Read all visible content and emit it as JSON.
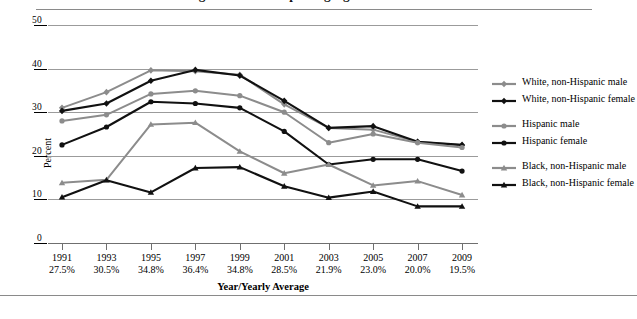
{
  "figure": {
    "title_partial": "Percentage of students reporting cigarette use",
    "y_axis_title": "Percent",
    "x_axis_title": "Year/Yearly Average"
  },
  "chart_data": {
    "type": "line",
    "title": "Percentage of students reporting cigarette use",
    "xlabel": "Year/Yearly Average",
    "ylabel": "Percent",
    "ylim": [
      0,
      50
    ],
    "yticks": [
      0,
      10,
      20,
      30,
      40,
      50
    ],
    "grid": true,
    "legend_position": "right",
    "categories": [
      "1991",
      "1993",
      "1995",
      "1997",
      "1999",
      "2001",
      "2003",
      "2005",
      "2007",
      "2009"
    ],
    "category_sublabels": [
      "27.5%",
      "30.5%",
      "34.8%",
      "36.4%",
      "34.8%",
      "28.5%",
      "21.9%",
      "23.0%",
      "20.0%",
      "19.5%"
    ],
    "series": [
      {
        "name": "White, non-Hispanic male",
        "color": "#8c8c8c",
        "marker": "diamond",
        "values": [
          31.0,
          34.6,
          39.6,
          39.4,
          38.6,
          31.8,
          26.4,
          26.0,
          23.2,
          22.4
        ]
      },
      {
        "name": "White, non-Hispanic female",
        "color": "#111111",
        "marker": "diamond",
        "values": [
          30.3,
          32.0,
          37.2,
          39.7,
          38.4,
          32.6,
          26.4,
          26.8,
          23.2,
          22.5
        ]
      },
      {
        "name": "Hispanic male",
        "color": "#8c8c8c",
        "marker": "circle",
        "values": [
          28.0,
          29.4,
          34.2,
          34.9,
          33.8,
          30.0,
          23.0,
          25.0,
          23.0,
          21.9
        ]
      },
      {
        "name": "Hispanic female",
        "color": "#111111",
        "marker": "circle",
        "values": [
          22.5,
          26.6,
          32.4,
          32.0,
          31.0,
          25.6,
          18.0,
          19.2,
          19.2,
          16.5
        ]
      },
      {
        "name": "Black, non-Hispanic male",
        "color": "#8c8c8c",
        "marker": "triangle",
        "values": [
          13.8,
          14.5,
          27.2,
          27.6,
          21.0,
          16.0,
          18.0,
          13.2,
          14.2,
          11.0
        ]
      },
      {
        "name": "Black, non-Hispanic female",
        "color": "#111111",
        "marker": "triangle",
        "values": [
          10.5,
          14.4,
          11.6,
          17.2,
          17.4,
          13.0,
          10.4,
          11.8,
          8.4,
          8.4
        ]
      }
    ]
  }
}
